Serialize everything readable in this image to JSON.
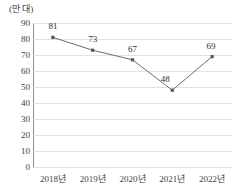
{
  "chart_data": {
    "type": "line",
    "title": "",
    "unit_label": "(만 대)",
    "xlabel": "",
    "ylabel": "",
    "categories": [
      "2018년",
      "2019년",
      "2020년",
      "2021년",
      "2022년"
    ],
    "values": [
      81,
      73,
      67,
      48,
      69
    ],
    "data_labels": [
      "81",
      "73",
      "67",
      "48",
      "69"
    ],
    "yticks": [
      90,
      80,
      70,
      60,
      50,
      40,
      30,
      20,
      10,
      0
    ],
    "ytick_labels": [
      "90",
      "80",
      "70",
      "60",
      "50",
      "40",
      "30",
      "20",
      "10",
      "0"
    ],
    "ylim": [
      0,
      90
    ],
    "grid": "horizontal",
    "legend": "none",
    "series": [
      {
        "name": "",
        "values": [
          81,
          73,
          67,
          48,
          69
        ]
      }
    ],
    "colors": {
      "line": "#6b6b6b",
      "marker": "#555555",
      "gridline": "#e2e2e2",
      "axis": "#8d8d8d",
      "text": "#3d3d3d",
      "background": "#ffffff"
    },
    "marker_style": "square"
  }
}
